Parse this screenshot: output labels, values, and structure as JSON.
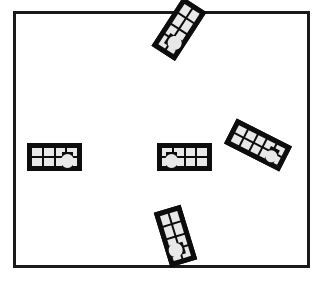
{
  "canvas": {
    "width": 325,
    "height": 290,
    "background": "#ffffff"
  },
  "frame": {
    "label": "bounding-rectangle",
    "x": 13,
    "y": 11,
    "width": 297,
    "height": 257,
    "stroke": "#1a1a1a",
    "stroke_width": 3,
    "fill": "#ffffff"
  },
  "style": {
    "piece_outline": "#0d0d0d",
    "piece_outline_width": 4,
    "cell_fill": "#e8e8e8",
    "cell_stroke": "#0d0d0d",
    "cell_stroke_width": 2,
    "knob_fill": "#e8e8e8",
    "knob_stroke": "#0d0d0d"
  },
  "scene": {
    "description": "Five rectangular grid-pattern tiles scattered at varying rotations inside a rectangular frame",
    "piece_count": 5
  },
  "pieces": [
    {
      "id": "piece-top",
      "label": "top-tile",
      "x": 150,
      "y": 15,
      "width": 58,
      "height": 28,
      "rotation": -57,
      "rows": 2,
      "cols": 4,
      "knob_end": "left",
      "center_x": 179,
      "center_y": 29
    },
    {
      "id": "piece-left",
      "label": "left-tile",
      "x": 27,
      "y": 143,
      "width": 55,
      "height": 28,
      "rotation": 0,
      "rows": 2,
      "cols": 4,
      "knob_end": "right",
      "center_x": 54,
      "center_y": 157
    },
    {
      "id": "piece-center",
      "label": "center-tile",
      "x": 157,
      "y": 143,
      "width": 55,
      "height": 28,
      "rotation": 0,
      "rows": 2,
      "cols": 4,
      "knob_end": "left",
      "center_x": 184,
      "center_y": 157
    },
    {
      "id": "piece-right",
      "label": "right-tile",
      "x": 227,
      "y": 131,
      "width": 62,
      "height": 28,
      "rotation": 27,
      "rows": 2,
      "cols": 5,
      "knob_end": "right",
      "center_x": 258,
      "center_y": 145
    },
    {
      "id": "piece-bottom",
      "label": "bottom-tile",
      "x": 147,
      "y": 222,
      "width": 57,
      "height": 28,
      "rotation": 73,
      "rows": 2,
      "cols": 4,
      "knob_end": "right",
      "center_x": 175,
      "center_y": 236
    }
  ]
}
